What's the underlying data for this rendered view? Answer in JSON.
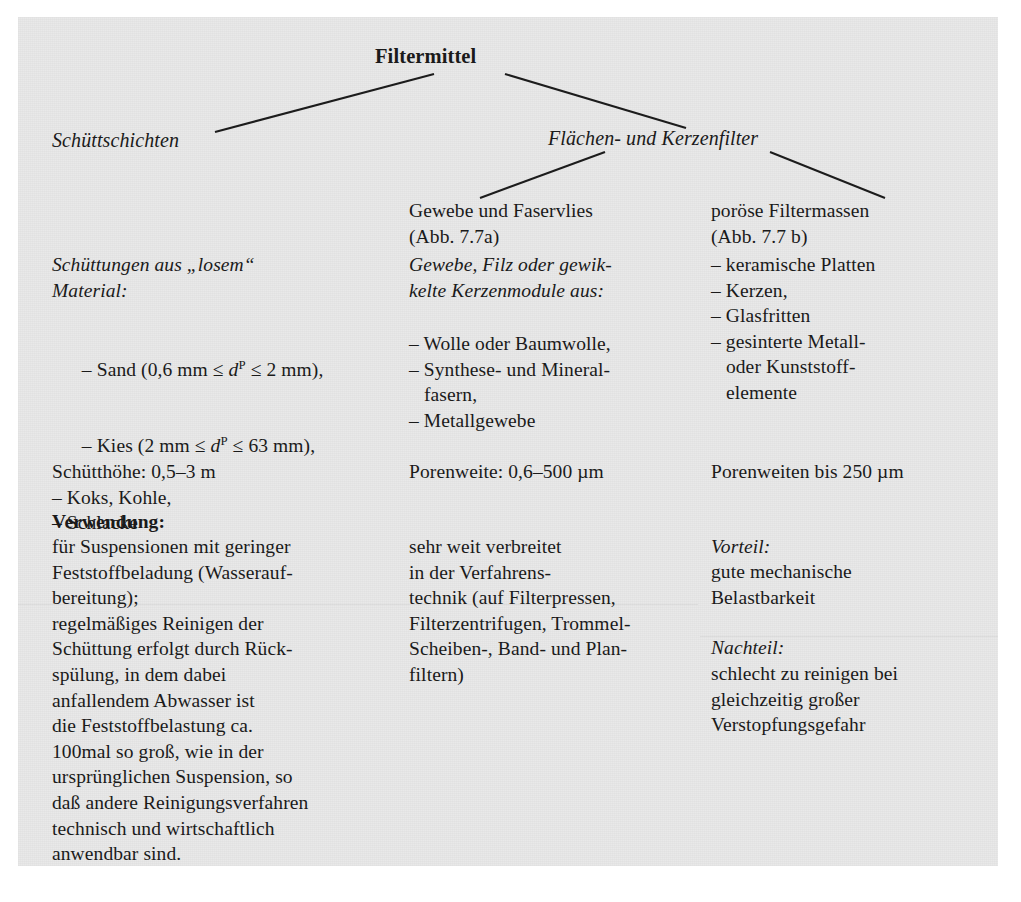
{
  "diagram": {
    "root": "Filtermittel",
    "branch_left": "Schüttschichten",
    "branch_right": "Flächen- und Kerzenfilter"
  },
  "columns": {
    "left": {
      "heading_italic_line1": "Schüttungen aus „losem“",
      "heading_italic_line2": "Material:",
      "bullets": [
        "– Sand (0,6 mm ≤ d",
        "– Kies (2 mm ≤ d",
        "– Koks, Kohle,",
        "– Schlacke"
      ],
      "bullet_sand_pre": "– Sand (0,6 mm ≤ ",
      "bullet_sand_var": "d",
      "bullet_sand_sup": "P",
      "bullet_sand_post": " ≤ 2 mm),",
      "bullet_kies_pre": "– Kies (2 mm ≤ ",
      "bullet_kies_var": "d",
      "bullet_kies_sup": "P",
      "bullet_kies_post": " ≤ 63 mm),",
      "bullet_koks": "– Koks, Kohle,",
      "bullet_schlacke": "– Schlacke",
      "measure": "Schütthöhe: 0,5–3 m",
      "usage_label": "Verwendung:",
      "usage_lines": [
        "für Suspensionen mit geringer",
        "Feststoffbeladung (Wasserauf-",
        "bereitung);",
        "regelmäßiges Reinigen der",
        "Schüttung erfolgt durch Rück-",
        "spülung, in dem dabei",
        "anfallendem Abwasser ist",
        "die Feststoffbelastung ca.",
        "100mal so groß, wie in der",
        "ursprünglichen Suspension, so",
        "daß andere Reinigungsverfahren",
        "technisch und wirtschaftlich",
        "anwendbar sind."
      ]
    },
    "middle": {
      "heading_lines": [
        "Gewebe und Faservlies",
        "(Abb. 7.7a)"
      ],
      "subheading_italic_lines": [
        "Gewebe, Filz oder gewik-",
        "kelte Kerzenmodule aus:"
      ],
      "bullets": [
        "– Wolle oder Baumwolle,",
        "– Synthese- und Mineral-",
        "   fasern,",
        "– Metallgewebe"
      ],
      "measure": "Porenweite: 0,6–500 µm",
      "usage_lines": [
        "sehr weit verbreitet",
        "in der Verfahrens-",
        "technik (auf Filterpressen,",
        "Filterzentrifugen, Trommel-",
        "Scheiben-, Band- und Plan-",
        "filtern)"
      ]
    },
    "right": {
      "heading_lines": [
        "poröse Filtermassen",
        "(Abb. 7.7 b)"
      ],
      "bullets": [
        "– keramische Platten",
        "– Kerzen,",
        "– Glasfritten",
        "– gesinterte Metall-",
        "   oder Kunststoff-",
        "   elemente"
      ],
      "measure": "Porenweiten bis 250 µm",
      "advantage_label": "Vorteil:",
      "advantage_lines": [
        "gute mechanische",
        "Belastbarkeit"
      ],
      "disadvantage_label": "Nachteil:",
      "disadvantage_lines": [
        "schlecht zu reinigen bei",
        "gleichzeitig großer",
        "Verstopfungsgefahr"
      ]
    }
  }
}
